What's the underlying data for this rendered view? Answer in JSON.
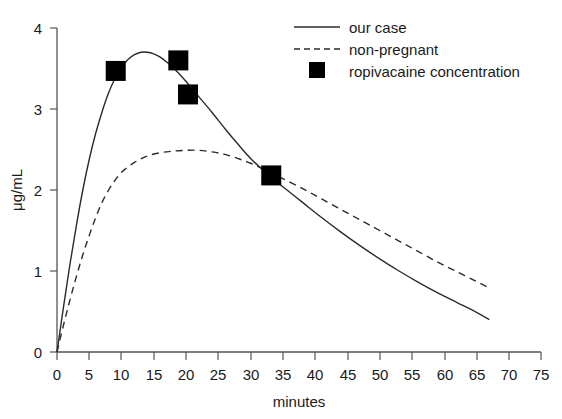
{
  "chart_data": {
    "type": "line",
    "title": "",
    "xlabel": "minutes",
    "ylabel": "μg/mL",
    "xlim": [
      0,
      75
    ],
    "ylim": [
      0,
      4
    ],
    "xticks": [
      0,
      5,
      10,
      15,
      20,
      25,
      30,
      35,
      40,
      45,
      50,
      55,
      60,
      65,
      70,
      75
    ],
    "yticks": [
      0,
      1,
      2,
      3,
      4
    ],
    "grid": false,
    "legend_position": "top-right",
    "series": [
      {
        "name": "our case",
        "style": "solid",
        "points": [
          [
            0.0,
            0.0
          ],
          [
            1.0,
            0.55
          ],
          [
            2.0,
            1.08
          ],
          [
            3.0,
            1.56
          ],
          [
            4.0,
            2.0
          ],
          [
            5.0,
            2.38
          ],
          [
            6.0,
            2.7
          ],
          [
            7.0,
            2.97
          ],
          [
            8.0,
            3.2
          ],
          [
            9.0,
            3.38
          ],
          [
            10.0,
            3.52
          ],
          [
            11.0,
            3.61
          ],
          [
            12.0,
            3.67
          ],
          [
            13.0,
            3.7
          ],
          [
            14.0,
            3.7
          ],
          [
            15.0,
            3.68
          ],
          [
            16.0,
            3.64
          ],
          [
            17.0,
            3.58
          ],
          [
            18.0,
            3.51
          ],
          [
            19.0,
            3.43
          ],
          [
            20.0,
            3.34
          ],
          [
            22.0,
            3.15
          ],
          [
            24.0,
            2.96
          ],
          [
            26.0,
            2.76
          ],
          [
            28.0,
            2.57
          ],
          [
            30.0,
            2.39
          ],
          [
            32.0,
            2.24
          ],
          [
            33.2,
            2.16
          ],
          [
            35.0,
            2.04
          ],
          [
            38.0,
            1.85
          ],
          [
            41.0,
            1.66
          ],
          [
            44.0,
            1.48
          ],
          [
            47.0,
            1.31
          ],
          [
            50.0,
            1.15
          ],
          [
            53.0,
            1.0
          ],
          [
            56.0,
            0.86
          ],
          [
            59.0,
            0.73
          ],
          [
            62.0,
            0.61
          ],
          [
            65.0,
            0.49
          ],
          [
            67.0,
            0.4
          ]
        ]
      },
      {
        "name": "non-pregnant",
        "style": "dashed",
        "points": [
          [
            0.0,
            0.0
          ],
          [
            1.0,
            0.33
          ],
          [
            2.0,
            0.64
          ],
          [
            3.0,
            0.93
          ],
          [
            4.0,
            1.2
          ],
          [
            5.0,
            1.44
          ],
          [
            6.0,
            1.66
          ],
          [
            7.0,
            1.85
          ],
          [
            8.0,
            2.0
          ],
          [
            9.0,
            2.12
          ],
          [
            10.0,
            2.22
          ],
          [
            12.0,
            2.34
          ],
          [
            14.0,
            2.42
          ],
          [
            16.0,
            2.46
          ],
          [
            18.0,
            2.48
          ],
          [
            20.0,
            2.49
          ],
          [
            22.0,
            2.49
          ],
          [
            24.0,
            2.47
          ],
          [
            26.0,
            2.44
          ],
          [
            28.0,
            2.39
          ],
          [
            30.0,
            2.33
          ],
          [
            32.0,
            2.26
          ],
          [
            33.2,
            2.21
          ],
          [
            35.0,
            2.14
          ],
          [
            38.0,
            2.02
          ],
          [
            41.0,
            1.89
          ],
          [
            44.0,
            1.76
          ],
          [
            47.0,
            1.63
          ],
          [
            50.0,
            1.5
          ],
          [
            53.0,
            1.37
          ],
          [
            56.0,
            1.24
          ],
          [
            59.0,
            1.11
          ],
          [
            62.0,
            0.99
          ],
          [
            65.0,
            0.87
          ],
          [
            67.0,
            0.79
          ]
        ]
      },
      {
        "name": "ropivacaine concentration",
        "style": "marker",
        "points": [
          [
            9.1,
            3.47
          ],
          [
            18.8,
            3.6
          ],
          [
            20.3,
            3.18
          ],
          [
            33.2,
            2.18
          ]
        ]
      }
    ],
    "legend": [
      {
        "label": "our case",
        "symbol": "solid-line"
      },
      {
        "label": "non-pregnant",
        "symbol": "dashed-line"
      },
      {
        "label": "ropivacaine concentration",
        "symbol": "filled-square"
      }
    ],
    "colors": {
      "series_line": "#2b2b2b",
      "marker": "#000000",
      "axis": "#555555",
      "text": "#1a1a1a",
      "background": "#ffffff"
    }
  }
}
